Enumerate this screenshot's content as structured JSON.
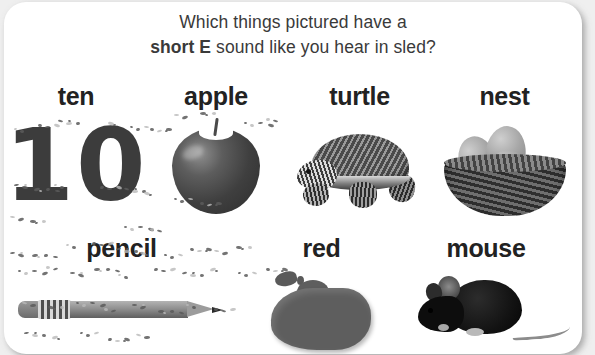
{
  "worksheet": {
    "title_line1": "Which things pictured have a",
    "title_bold": "short E",
    "title_rest": " sound like you hear in sled?",
    "text_color": "#3a3a3a",
    "label_color": "#222222",
    "card_background": "#ffffff",
    "page_background": "#efefef"
  },
  "rows": [
    {
      "items": [
        {
          "label": "ten",
          "art": "number-10-art",
          "art_text": "10"
        },
        {
          "label": "apple",
          "art": "apple-photo-art",
          "art_text": ""
        },
        {
          "label": "turtle",
          "art": "turtle-photo-art",
          "art_text": ""
        },
        {
          "label": "nest",
          "art": "nest-photo-art",
          "art_text": ""
        }
      ]
    },
    {
      "items": [
        {
          "label": "pencil",
          "art": "pencil-photo-art",
          "art_text": ""
        },
        {
          "label": "red",
          "art": "red-blob-art",
          "art_text": ""
        },
        {
          "label": "mouse",
          "art": "mouse-photo-art",
          "art_text": ""
        }
      ]
    }
  ]
}
